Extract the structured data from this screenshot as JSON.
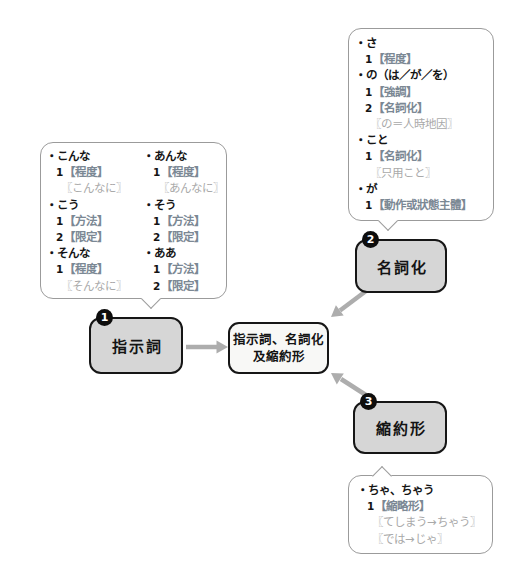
{
  "colors": {
    "node_fill": "#d6d6d6",
    "node_border": "#161616",
    "center_fill": "#f8f8f6",
    "bubble_border": "#9b9b9b",
    "arrow": "#adadad",
    "term_text": "#7b8894",
    "gloss_text": "#a9a9a9",
    "badge_bg": "#0d0d0d",
    "badge_text": "#ffffff"
  },
  "center_box": {
    "line1": "指示詞、名詞化",
    "line2": "及縮約形"
  },
  "nodes": [
    {
      "badge": "1",
      "label": "指示詞"
    },
    {
      "badge": "2",
      "label": "名詞化"
    },
    {
      "badge": "3",
      "label": "縮約形"
    }
  ],
  "bubbles": {
    "demonstratives_left": [
      {
        "type": "head",
        "marker": "・",
        "text": "こんな"
      },
      {
        "type": "num",
        "marker": "1",
        "text": "【程度】"
      },
      {
        "type": "gloss",
        "marker": "",
        "text": "〖こんなに〗"
      },
      {
        "type": "head",
        "marker": "・",
        "text": "こう"
      },
      {
        "type": "num",
        "marker": "1",
        "text": "【方法】"
      },
      {
        "type": "num",
        "marker": "2",
        "text": "【限定】"
      },
      {
        "type": "head",
        "marker": "・",
        "text": "そんな"
      },
      {
        "type": "num",
        "marker": "1",
        "text": "【程度】"
      },
      {
        "type": "gloss",
        "marker": "",
        "text": "〖そんなに〗"
      }
    ],
    "demonstratives_right": [
      {
        "type": "head",
        "marker": "・",
        "text": "あんな"
      },
      {
        "type": "num",
        "marker": "1",
        "text": "【程度】"
      },
      {
        "type": "gloss",
        "marker": "",
        "text": "〖あんなに〗"
      },
      {
        "type": "head",
        "marker": "・",
        "text": "そう"
      },
      {
        "type": "num",
        "marker": "1",
        "text": "【方法】"
      },
      {
        "type": "num",
        "marker": "2",
        "text": "【限定】"
      },
      {
        "type": "head",
        "marker": "・",
        "text": "ああ"
      },
      {
        "type": "num",
        "marker": "1",
        "text": "【方法】"
      },
      {
        "type": "num",
        "marker": "2",
        "text": "【限定】"
      }
    ],
    "nominalization": [
      {
        "type": "head",
        "marker": "・",
        "text": "さ"
      },
      {
        "type": "num",
        "marker": "1",
        "text": "【程度】"
      },
      {
        "type": "head",
        "marker": "・",
        "text": "の（は／が／を）"
      },
      {
        "type": "num",
        "marker": "1",
        "text": "【強調】"
      },
      {
        "type": "num",
        "marker": "2",
        "text": "【名詞化】"
      },
      {
        "type": "gloss",
        "marker": "",
        "text": "〖の＝人時地因〗"
      },
      {
        "type": "head",
        "marker": "・",
        "text": "こと"
      },
      {
        "type": "num",
        "marker": "1",
        "text": "【名詞化】"
      },
      {
        "type": "gloss",
        "marker": "",
        "text": "〖只用こと〗"
      },
      {
        "type": "head",
        "marker": "・",
        "text": "が"
      },
      {
        "type": "num",
        "marker": "1",
        "text": "【動作或狀態主體】"
      }
    ],
    "contraction": [
      {
        "type": "head",
        "marker": "・",
        "text": "ちゃ、ちゃう"
      },
      {
        "type": "num",
        "marker": "1",
        "text": "【縮略形】"
      },
      {
        "type": "gloss",
        "marker": "",
        "text": "〖てしまう→ちゃう〗"
      },
      {
        "type": "gloss",
        "marker": "",
        "text": "〖では→じゃ〗"
      }
    ]
  }
}
